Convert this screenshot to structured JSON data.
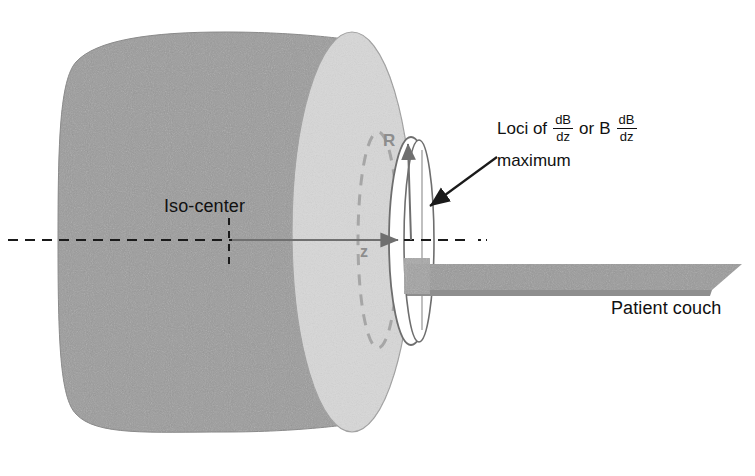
{
  "figure": {
    "type": "mri-scanner-schematic",
    "background_color": "#ffffff"
  },
  "colors": {
    "scanner_body": "#9b9b9b",
    "scanner_front_face": "#d7d7d7",
    "bore_opening": "#ffffff",
    "couch": "#9a9a9a",
    "axis_line": "#1a1a1a",
    "gray_annotation": "#8d8d8d",
    "outline": "#6e6e6e",
    "text": "#111111"
  },
  "labels": {
    "iso_center": "Iso-center",
    "patient_couch": "Patient couch",
    "radius": "R",
    "z_axis": "z"
  },
  "annotation": {
    "line1_prefix": "Loci of",
    "fraction1": {
      "numerator": "dB",
      "denominator": "dz"
    },
    "connector": "or",
    "field_symbol": "B",
    "fraction2": {
      "numerator": "dB",
      "denominator": "dz"
    },
    "line2": "maximum"
  },
  "geometry": {
    "scanner_body_left_x": 58,
    "scanner_body_right_x": 352,
    "scanner_top_y": 32,
    "scanner_bottom_y": 432,
    "front_face_center_x": 352,
    "front_face_rx": 58,
    "front_face_ry": 200,
    "bore_center_x": 411,
    "bore_rx": 21,
    "bore_ry": 103,
    "isoplane_dashed_ellipse_x": 378,
    "axis_y": 240,
    "iso_center_tick_x": 229,
    "axis_dash_start_x": 8,
    "axis_dash_end_x": 487,
    "z_arrow_start_x": 232,
    "z_arrow_end_x": 401,
    "couch_left_x": 404,
    "couch_right_x": 742,
    "couch_top_y": 258,
    "couch_thickness": 10,
    "arrow_tail": [
      497,
      158
    ],
    "arrow_head": [
      428,
      208
    ]
  }
}
